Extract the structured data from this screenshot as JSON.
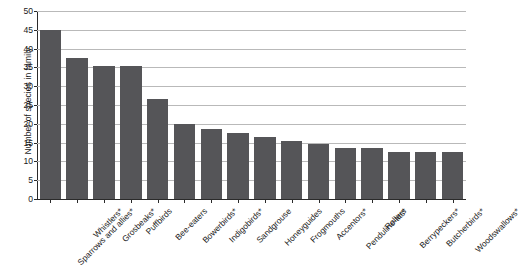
{
  "chart_data": {
    "type": "bar",
    "title": "",
    "xlabel": "",
    "ylabel": "Number of species in family",
    "ylim": [
      0,
      50
    ],
    "ytick_step": 5,
    "yticks": [
      0,
      5,
      10,
      15,
      20,
      25,
      30,
      35,
      40,
      45,
      50
    ],
    "grid": "horizontal",
    "legend": "none",
    "bar_color": "#555558",
    "gridline_color": "#b9b9b9",
    "axis_color": "#2a2a2a",
    "categories": [
      "Sparrows and allies*",
      "Whistlers*",
      "Grosbeaks*",
      "Puffbirds",
      "Bee-eaters",
      "Bowerbirds*",
      "Indigobirds*",
      "Sandgrouse",
      "Honeyguides",
      "Frogmouths",
      "Accentors*",
      "Penduline-tits*",
      "Rollers",
      "Berrypeckers*",
      "Butcherbirds*",
      "Woodswallows*"
    ],
    "values": [
      45,
      37.5,
      35.5,
      35.5,
      26.5,
      20,
      18.5,
      17.5,
      16.5,
      15.5,
      14.5,
      13.5,
      13.5,
      12.5,
      12.5,
      12.5
    ]
  }
}
